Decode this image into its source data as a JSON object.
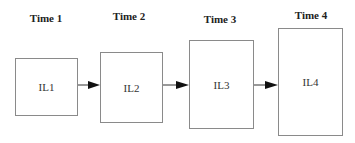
{
  "diagram": {
    "type": "sequence",
    "stages": [
      {
        "time_label": "Time 1",
        "box_label": "IL1"
      },
      {
        "time_label": "Time 2",
        "box_label": "IL2"
      },
      {
        "time_label": "Time 3",
        "box_label": "IL3"
      },
      {
        "time_label": "Time 4",
        "box_label": "IL4"
      }
    ],
    "arrows": [
      {
        "from": "IL1",
        "to": "IL2"
      },
      {
        "from": "IL2",
        "to": "IL3"
      },
      {
        "from": "IL3",
        "to": "IL4"
      }
    ],
    "colors": {
      "box_border": "#8a8a8a",
      "arrow": "#222222",
      "text": "#222222"
    }
  }
}
